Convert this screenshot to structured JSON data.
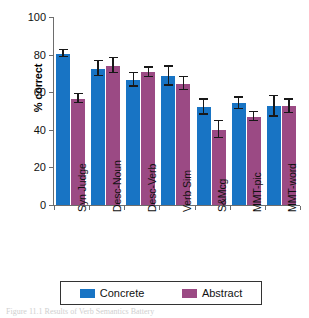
{
  "chart_data": {
    "type": "bar",
    "title": "",
    "xlabel": "",
    "ylabel": "% correct",
    "ylim": [
      0,
      100
    ],
    "yticks": [
      0,
      20,
      40,
      60,
      80,
      100
    ],
    "ytick_labels": [
      "0",
      "20",
      "40",
      "60",
      "80",
      "100"
    ],
    "grid": false,
    "legend_position": "bottom",
    "categories": [
      "Syn Judge",
      "Desc-Noun",
      "Desc-Verb",
      "Verb Sim",
      "S&Mcg",
      "MMT-pic",
      "MMT-word"
    ],
    "series": [
      {
        "name": "Concrete",
        "color": "#1874c4",
        "values": [
          80.5,
          72.5,
          66.5,
          68.5,
          52.0,
          54.0,
          52.5
        ],
        "errors": [
          2.0,
          4.0,
          3.5,
          5.0,
          4.0,
          3.0,
          5.5
        ]
      },
      {
        "name": "Abstract",
        "color": "#9b4a84",
        "values": [
          56.5,
          74.0,
          70.5,
          64.5,
          40.0,
          47.0,
          52.5
        ],
        "errors": [
          2.5,
          4.0,
          2.5,
          3.5,
          4.5,
          2.5,
          3.5
        ]
      }
    ]
  },
  "legend": {
    "items": [
      {
        "label": "Concrete",
        "color": "#1874c4"
      },
      {
        "label": "Abstract",
        "color": "#9b4a84"
      }
    ]
  },
  "caption": "Figure 11.1 Results of Verb Semantics Battery"
}
